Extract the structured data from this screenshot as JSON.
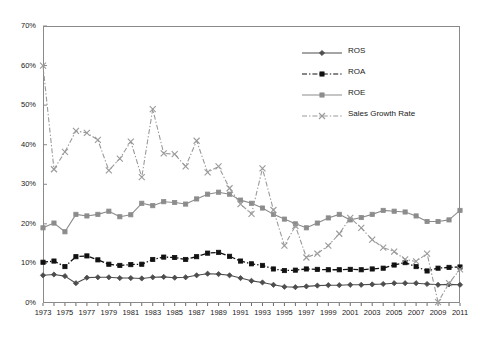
{
  "chart_data": {
    "type": "line",
    "title": "",
    "xlabel": "",
    "ylabel": "",
    "x": [
      1973,
      1974,
      1975,
      1976,
      1977,
      1978,
      1979,
      1980,
      1981,
      1982,
      1983,
      1984,
      1985,
      1986,
      1987,
      1988,
      1989,
      1990,
      1991,
      1992,
      1993,
      1994,
      1995,
      1996,
      1997,
      1998,
      1999,
      2000,
      2001,
      2002,
      2003,
      2004,
      2005,
      2006,
      2007,
      2008,
      2009,
      2010,
      2011
    ],
    "xtick_labels": [
      "1973",
      "1975",
      "1977",
      "1979",
      "1981",
      "1983",
      "1985",
      "1987",
      "1989",
      "1991",
      "1993",
      "1995",
      "1997",
      "1999",
      "2001",
      "2003",
      "2005",
      "2007",
      "2009",
      "2011"
    ],
    "xtick_values": [
      1973,
      1975,
      1977,
      1979,
      1981,
      1983,
      1985,
      1987,
      1989,
      1991,
      1993,
      1995,
      1997,
      1999,
      2001,
      2003,
      2005,
      2007,
      2009,
      2011
    ],
    "xlim": [
      1973,
      2011
    ],
    "ylim": [
      0,
      70
    ],
    "ytick_labels": [
      "0%",
      "10%",
      "20%",
      "30%",
      "40%",
      "50%",
      "60%",
      "70%"
    ],
    "ytick_values": [
      0,
      10,
      20,
      30,
      40,
      50,
      60,
      70
    ],
    "grid": false,
    "legend_position": "upper-right",
    "series": [
      {
        "name": "ROS",
        "color": "#4d4d4d",
        "marker": "diamond",
        "dash": "solid",
        "values": [
          7.0,
          7.2,
          6.8,
          5.0,
          6.4,
          6.5,
          6.5,
          6.3,
          6.3,
          6.2,
          6.5,
          6.6,
          6.4,
          6.5,
          7.0,
          7.4,
          7.3,
          7.0,
          6.3,
          5.6,
          5.2,
          4.6,
          4.1,
          4.0,
          4.2,
          4.4,
          4.5,
          4.5,
          4.6,
          4.6,
          4.7,
          4.8,
          5.0,
          5.0,
          5.0,
          4.8,
          4.6,
          4.7,
          4.6
        ]
      },
      {
        "name": "ROA",
        "color": "#111111",
        "marker": "square",
        "dash": "dashdot",
        "values": [
          10.3,
          10.6,
          9.2,
          11.7,
          11.9,
          10.9,
          9.8,
          9.5,
          9.7,
          9.8,
          11.0,
          11.6,
          11.5,
          11.0,
          11.7,
          12.6,
          12.8,
          11.8,
          10.6,
          9.9,
          9.5,
          8.6,
          8.2,
          8.3,
          8.6,
          8.5,
          8.4,
          8.4,
          8.5,
          8.4,
          8.6,
          8.8,
          9.6,
          10.2,
          9.2,
          8.1,
          8.8,
          9.0,
          9.1
        ]
      },
      {
        "name": "ROE",
        "color": "#8c8c8c",
        "marker": "square",
        "dash": "solid",
        "values": [
          19.0,
          20.2,
          18.0,
          22.4,
          22.0,
          22.4,
          23.2,
          21.8,
          22.3,
          25.2,
          24.6,
          25.6,
          25.4,
          25.0,
          26.3,
          27.5,
          28.0,
          27.5,
          26.0,
          25.2,
          24.0,
          22.4,
          21.2,
          20.0,
          19.0,
          20.2,
          21.5,
          22.4,
          21.0,
          21.6,
          22.4,
          23.4,
          23.2,
          23.0,
          22.0,
          20.6,
          20.6,
          21.0,
          23.4
        ]
      },
      {
        "name": "Sales Growth Rate",
        "color": "#9a9a9a",
        "marker": "cross",
        "dash": "dashdot",
        "values": [
          60.0,
          33.8,
          38.2,
          43.5,
          43.0,
          41.2,
          33.5,
          36.5,
          40.8,
          31.8,
          49.0,
          37.8,
          37.6,
          34.5,
          41.0,
          33.0,
          34.5,
          29.0,
          25.0,
          22.5,
          34.0,
          23.5,
          14.5,
          19.5,
          11.5,
          12.5,
          14.5,
          17.5,
          21.5,
          19.0,
          16.0,
          14.0,
          13.0,
          11.0,
          10.5,
          12.5,
          0.2,
          5.0,
          8.5
        ]
      }
    ]
  }
}
